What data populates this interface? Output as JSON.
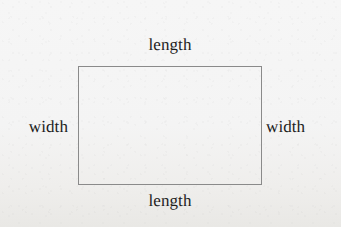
{
  "figure": {
    "shape": "rectangle",
    "background_color": "#f4f4f4",
    "outline_color": "#8a8a8a",
    "text_color": "#1d1d1d",
    "labels": {
      "length_top": "length",
      "length_bottom": "length",
      "width_left": "width",
      "width_right": "width"
    }
  }
}
